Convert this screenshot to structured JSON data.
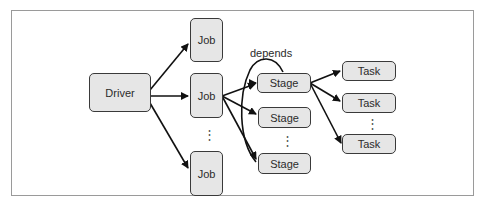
{
  "diagram": {
    "frame_color": "#9a9a9a",
    "node_fill": "#e6e6e6",
    "node_border": "#3a3a3a",
    "edge_color": "#111111",
    "nodes": {
      "driver": {
        "label": "Driver"
      },
      "jobs": [
        {
          "label": "Job"
        },
        {
          "label": "Job"
        },
        {
          "label": "Job"
        }
      ],
      "stages": [
        {
          "label": "Stage"
        },
        {
          "label": "Stage"
        },
        {
          "label": "Stage"
        }
      ],
      "tasks": [
        {
          "label": "Task"
        },
        {
          "label": "Task"
        },
        {
          "label": "Task"
        }
      ]
    },
    "ellipsis": "⋮",
    "edge_labels": {
      "depends": "depends"
    },
    "edges": [
      {
        "from": "Driver",
        "to": "Job 1"
      },
      {
        "from": "Driver",
        "to": "Job 2"
      },
      {
        "from": "Driver",
        "to": "Job 3"
      },
      {
        "from": "Job 2",
        "to": "Stage 1"
      },
      {
        "from": "Job 2",
        "to": "Stage 2"
      },
      {
        "from": "Job 2",
        "to": "Stage 3"
      },
      {
        "from": "Stage 3",
        "to": "Stage 1",
        "label": "depends"
      },
      {
        "from": "Stage 1",
        "to": "Task 1"
      },
      {
        "from": "Stage 1",
        "to": "Task 2"
      },
      {
        "from": "Stage 1",
        "to": "Task 3"
      }
    ]
  }
}
